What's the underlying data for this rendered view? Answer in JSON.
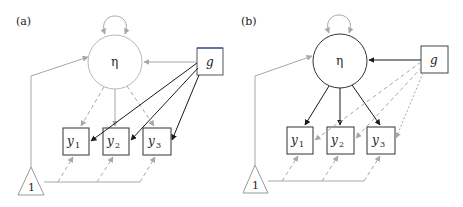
{
  "figure": {
    "panels": [
      {
        "id": "a",
        "label": "(a)",
        "latent": "η",
        "covariate": "g",
        "indicators": [
          {
            "name": "y",
            "sub": "1"
          },
          {
            "name": "y",
            "sub": "2"
          },
          {
            "name": "y",
            "sub": "3"
          }
        ],
        "constant": "1",
        "emphasis": "direct effects g → y1, y2, y3 (solid black); η paths gray"
      },
      {
        "id": "b",
        "label": "(b)",
        "latent": "η",
        "covariate": "g",
        "indicators": [
          {
            "name": "y",
            "sub": "1"
          },
          {
            "name": "y",
            "sub": "2"
          },
          {
            "name": "y",
            "sub": "3"
          }
        ],
        "constant": "1",
        "emphasis": "g → η and η → y1, y2, y3 (solid black); direct g → y paths gray dashed"
      }
    ],
    "colors": {
      "strong": "#1a1a1a",
      "faint": "#a8a8a8",
      "box": "#333333",
      "accent_edge": "#3a4fb0"
    }
  }
}
